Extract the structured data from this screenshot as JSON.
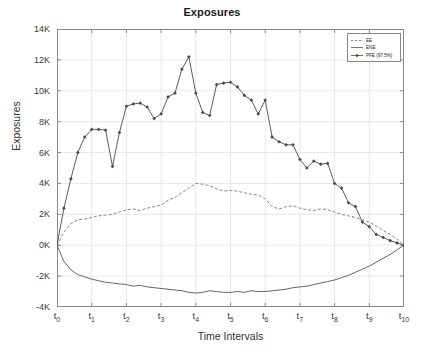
{
  "chart_data": {
    "type": "line",
    "title": "Exposures",
    "xlabel": "Time Intervals",
    "ylabel": "Exposures",
    "grid": true,
    "legend_position": "upper-right",
    "xlim": [
      0,
      10
    ],
    "ylim": [
      -4000,
      14000
    ],
    "ytick_labels": [
      "14K",
      "12K",
      "10K",
      "8K",
      "6K",
      "4K",
      "2K",
      "0K",
      "-2K",
      "-4K"
    ],
    "ytick_values": [
      14000,
      12000,
      10000,
      8000,
      6000,
      4000,
      2000,
      0,
      -2000,
      -4000
    ],
    "xtick_labels": [
      "t0",
      "t1",
      "t2",
      "t3",
      "t4",
      "t5",
      "t6",
      "t7",
      "t8",
      "t9",
      "t10"
    ],
    "xtick_bases": [
      "t",
      "t",
      "t",
      "t",
      "t",
      "t",
      "t",
      "t",
      "t",
      "t",
      "t"
    ],
    "xtick_subs": [
      "0",
      "1",
      "2",
      "3",
      "4",
      "5",
      "6",
      "7",
      "8",
      "9",
      "10"
    ],
    "xtick_values": [
      0,
      1,
      2,
      3,
      4,
      5,
      6,
      7,
      8,
      9,
      10
    ],
    "x": [
      0,
      0.2,
      0.4,
      0.6,
      0.8,
      1.0,
      1.2,
      1.4,
      1.6,
      1.8,
      2.0,
      2.2,
      2.4,
      2.6,
      2.8,
      3.0,
      3.2,
      3.4,
      3.6,
      3.8,
      4.0,
      4.2,
      4.4,
      4.6,
      4.8,
      5.0,
      5.2,
      5.4,
      5.6,
      5.8,
      6.0,
      6.2,
      6.4,
      6.6,
      6.8,
      7.0,
      7.2,
      7.4,
      7.6,
      7.8,
      8.0,
      8.2,
      8.4,
      8.6,
      8.8,
      9.0,
      9.2,
      9.4,
      9.6,
      9.8,
      10.0
    ],
    "series": [
      {
        "name": "PFE (97.5%)",
        "style": "solid-marker",
        "color": "#4a4a4a",
        "marker": "diamond",
        "values": [
          0,
          2400,
          4300,
          6000,
          7000,
          7500,
          7500,
          7450,
          5100,
          7300,
          9000,
          9150,
          9200,
          8950,
          8200,
          8500,
          9600,
          9850,
          11400,
          12200,
          9850,
          8600,
          8400,
          10400,
          10500,
          10550,
          10250,
          9700,
          9400,
          8500,
          9400,
          7000,
          6700,
          6500,
          6500,
          5550,
          5000,
          5450,
          5250,
          5300,
          4000,
          3700,
          2750,
          2500,
          1500,
          1200,
          700,
          500,
          300,
          150,
          0
        ]
      },
      {
        "name": "EE",
        "style": "dashed",
        "color": "#777777",
        "values": [
          0,
          850,
          1400,
          1650,
          1700,
          1800,
          1900,
          1950,
          2000,
          2150,
          2300,
          2350,
          2250,
          2400,
          2500,
          2600,
          2900,
          3100,
          3400,
          3700,
          4000,
          3950,
          3850,
          3650,
          3500,
          3550,
          3500,
          3400,
          3300,
          3250,
          3000,
          2500,
          2350,
          2500,
          2550,
          2400,
          2300,
          2250,
          2350,
          2300,
          2150,
          2000,
          1900,
          1800,
          1650,
          1500,
          1250,
          950,
          700,
          400,
          0
        ]
      },
      {
        "name": "ENE",
        "style": "solid",
        "color": "#555555",
        "values": [
          0,
          -1050,
          -1600,
          -1900,
          -2050,
          -2200,
          -2300,
          -2400,
          -2450,
          -2500,
          -2550,
          -2650,
          -2600,
          -2700,
          -2750,
          -2800,
          -2850,
          -2900,
          -2950,
          -3050,
          -3100,
          -3050,
          -2950,
          -3000,
          -3050,
          -3050,
          -3000,
          -3050,
          -2950,
          -3000,
          -3000,
          -2950,
          -2900,
          -2850,
          -2750,
          -2700,
          -2650,
          -2550,
          -2450,
          -2350,
          -2250,
          -2100,
          -1950,
          -1750,
          -1550,
          -1350,
          -1100,
          -850,
          -600,
          -300,
          0
        ]
      }
    ],
    "legend_entries": [
      {
        "label": "EE",
        "style": "dashed",
        "color": "#777777"
      },
      {
        "label": "ENE",
        "style": "solid",
        "color": "#555555"
      },
      {
        "label": "PFE (97.5%)",
        "style": "solid-marker",
        "color": "#4a4a4a"
      }
    ]
  },
  "colors": {
    "background": "#ffffff",
    "grid": "#e8e8e8",
    "axis": "#8a8a8a",
    "text": "#333333"
  }
}
